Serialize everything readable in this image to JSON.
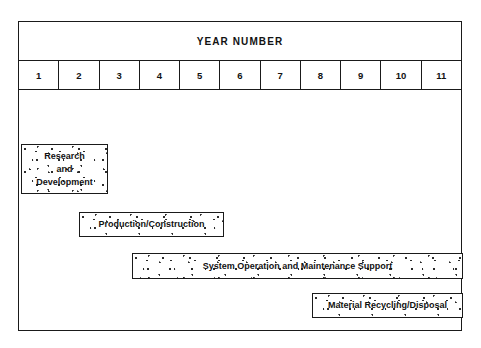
{
  "chart_data": {
    "type": "bar",
    "title": "YEAR NUMBER",
    "xlabel": "YEAR NUMBER",
    "ylabel": "",
    "orientation": "horizontal",
    "grid": false,
    "legend": "none",
    "axis_ticks": [
      "1",
      "2",
      "3",
      "4",
      "5",
      "6",
      "7",
      "8",
      "9",
      "10",
      "11"
    ],
    "xlim": [
      1,
      11
    ],
    "categories": [
      "Research and Development",
      "Production/Construction",
      "System Operation and Maintenance Support",
      "Material Recycling/Disposal"
    ],
    "bars": [
      {
        "label": "Research\nand\nDevelopment",
        "start_year": 1,
        "end_year": 3.2
      },
      {
        "label": "Production/Construction",
        "start_year": 2.5,
        "end_year": 6.1
      },
      {
        "label": "System Operation and Maintenance Support",
        "start_year": 3.8,
        "end_year": 12
      },
      {
        "label": "Material Recycling/Disposal",
        "start_year": 8.3,
        "end_year": 12
      }
    ]
  },
  "header": {
    "title": "YEAR NUMBER"
  },
  "year_row": {
    "cells": [
      "1",
      "2",
      "3",
      "4",
      "5",
      "6",
      "7",
      "8",
      "9",
      "10",
      "11"
    ]
  },
  "bars": {
    "research_development": {
      "label": "Research\nand\nDevelopment"
    },
    "production_construction": {
      "label": "Production/Construction"
    },
    "system_operation": {
      "label": "System Operation and Maintenance Support"
    },
    "material_recycling": {
      "label": "Material Recycling/Disposal"
    }
  },
  "colors": {
    "line": "#1a1a1a",
    "text": "#121212",
    "background": "#ffffff",
    "speckle": "#2b2b2b"
  }
}
